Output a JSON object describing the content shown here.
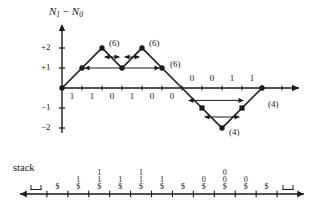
{
  "figure": {
    "type": "diagram",
    "bg_color": "#ffffff",
    "ink_color": "#1a1a1a"
  },
  "chart_data": {
    "type": "line",
    "title": "",
    "ylabel": "N1 - N0",
    "ylabel_parts": {
      "n": "N",
      "sub1": "1",
      "minus": "−",
      "n2": "N",
      "sub0": "0"
    },
    "xlabel": "",
    "ylim": [
      -2.6,
      2.6
    ],
    "yticks": [
      2,
      1,
      -1,
      -2
    ],
    "ytick_labels": [
      "+2",
      "+1",
      "−1",
      "−2"
    ],
    "grid": false,
    "legend": null,
    "x": [
      0,
      1,
      2,
      3,
      4,
      5,
      6,
      7,
      8,
      9,
      10
    ],
    "y": [
      0,
      1,
      2,
      1,
      2,
      1,
      0,
      -1,
      -2,
      -1,
      0
    ],
    "markers": [
      {
        "x": 0,
        "y": 0,
        "shape": "dot"
      },
      {
        "x": 1,
        "y": 1,
        "shape": "dot"
      },
      {
        "x": 2,
        "y": 2,
        "shape": "dot"
      },
      {
        "x": 3,
        "y": 1,
        "shape": "dot"
      },
      {
        "x": 4,
        "y": 2,
        "shape": "dot"
      },
      {
        "x": 5,
        "y": 1,
        "shape": "dot"
      },
      {
        "x": 7,
        "y": -1,
        "shape": "square"
      },
      {
        "x": 8,
        "y": -2,
        "shape": "dot"
      },
      {
        "x": 9,
        "y": -1,
        "shape": "square"
      },
      {
        "x": 10,
        "y": 0,
        "shape": "dot"
      }
    ],
    "bit_labels_below": [
      {
        "x": 0.5,
        "text": "1"
      },
      {
        "x": 1.5,
        "text": "1"
      },
      {
        "x": 2.5,
        "text": "0"
      },
      {
        "x": 3.5,
        "text": "1"
      },
      {
        "x": 4.5,
        "text": "0"
      },
      {
        "x": 5.5,
        "text": "0"
      }
    ],
    "bit_labels_above": [
      {
        "x": 6.5,
        "text": "0"
      },
      {
        "x": 7.5,
        "text": "0"
      },
      {
        "x": 8.5,
        "text": "1"
      },
      {
        "x": 9.5,
        "text": "1"
      }
    ],
    "span_arrows": [
      {
        "from_x": 1,
        "to_x": 5,
        "y": 1,
        "double": true
      },
      {
        "from_x": 2,
        "to_x": 3,
        "y": 1.55,
        "double": true
      },
      {
        "from_x": 3,
        "to_x": 4,
        "y": 1.55,
        "double": true
      },
      {
        "from_x": 6.2,
        "to_x": 9.2,
        "y": -0.62,
        "double": true
      },
      {
        "from_x": 7,
        "to_x": 9,
        "y": -1.45,
        "double": true
      }
    ],
    "annotations": [
      {
        "text": "(6)",
        "x": 2.35,
        "y": 2.25
      },
      {
        "text": "(6)",
        "x": 4.35,
        "y": 2.25
      },
      {
        "text": "(6)",
        "x": 5.4,
        "y": 1.2
      },
      {
        "text": "(4)",
        "x": 8.35,
        "y": -2.2
      },
      {
        "text": "(4)",
        "x": 10.3,
        "y": -0.8
      }
    ]
  },
  "stack_panel": {
    "label": "stack",
    "tick_count": 13,
    "cells": [
      {
        "index": 0,
        "contents": [
          "⊔"
        ],
        "kind": "empty"
      },
      {
        "index": 1,
        "contents": [
          "$"
        ],
        "kind": "normal"
      },
      {
        "index": 2,
        "contents": [
          "1",
          "$"
        ],
        "kind": "normal"
      },
      {
        "index": 3,
        "contents": [
          "1",
          "1",
          "$"
        ],
        "kind": "normal"
      },
      {
        "index": 4,
        "contents": [
          "1",
          "$"
        ],
        "kind": "normal"
      },
      {
        "index": 5,
        "contents": [
          "1",
          "1",
          "$"
        ],
        "kind": "normal"
      },
      {
        "index": 6,
        "contents": [
          "1",
          "$"
        ],
        "kind": "normal"
      },
      {
        "index": 7,
        "contents": [
          "$"
        ],
        "kind": "normal"
      },
      {
        "index": 8,
        "contents": [
          "0",
          "$"
        ],
        "kind": "normal"
      },
      {
        "index": 9,
        "contents": [
          "0",
          "0",
          "$"
        ],
        "kind": "normal"
      },
      {
        "index": 10,
        "contents": [
          "0",
          "$"
        ],
        "kind": "normal"
      },
      {
        "index": 11,
        "contents": [
          "$"
        ],
        "kind": "normal"
      },
      {
        "index": 12,
        "contents": [
          "⊔"
        ],
        "kind": "empty"
      }
    ]
  }
}
